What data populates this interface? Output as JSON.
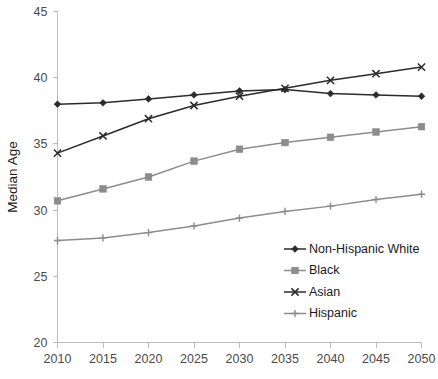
{
  "chart_data": {
    "type": "line",
    "title": "",
    "xlabel": "",
    "ylabel": "Median Age",
    "x": [
      2010,
      2015,
      2020,
      2025,
      2030,
      2035,
      2040,
      2045,
      2050
    ],
    "categories": [
      "2010",
      "2015",
      "2020",
      "2025",
      "2030",
      "2035",
      "2040",
      "2045",
      "2050"
    ],
    "xlim": [
      2010,
      2050
    ],
    "ylim": [
      20,
      45
    ],
    "y_ticks": [
      20,
      25,
      30,
      35,
      40,
      45
    ],
    "x_ticks": [
      2010,
      2015,
      2020,
      2025,
      2030,
      2035,
      2040,
      2045,
      2050
    ],
    "grid": false,
    "legend_position": "inside-bottom-right",
    "series": [
      {
        "name": "Non-Hispanic White",
        "color": "#2b2b2b",
        "marker": "diamond",
        "values": [
          38.0,
          38.1,
          38.4,
          38.7,
          39.0,
          39.1,
          38.8,
          38.7,
          38.6
        ]
      },
      {
        "name": "Black",
        "color": "#8c8c8c",
        "marker": "square",
        "values": [
          30.7,
          31.6,
          32.5,
          33.7,
          34.6,
          35.1,
          35.5,
          35.9,
          36.3
        ]
      },
      {
        "name": "Asian",
        "color": "#2b2b2b",
        "marker": "cross",
        "values": [
          34.3,
          35.6,
          36.9,
          37.9,
          38.6,
          39.2,
          39.8,
          40.3,
          40.8
        ]
      },
      {
        "name": "Hispanic",
        "color": "#8c8c8c",
        "marker": "plus",
        "values": [
          27.7,
          27.9,
          28.3,
          28.8,
          29.4,
          29.9,
          30.3,
          30.8,
          31.2
        ]
      }
    ]
  },
  "legend": {
    "entries": [
      {
        "label": "Non-Hispanic White"
      },
      {
        "label": "Black"
      },
      {
        "label": "Asian"
      },
      {
        "label": "Hispanic"
      }
    ]
  }
}
